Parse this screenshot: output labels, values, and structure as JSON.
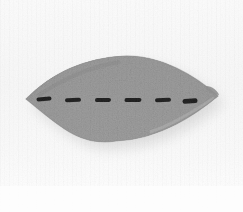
{
  "image": {
    "kind": "photograph",
    "subject": "gray textile leaf-shaped pad with stitched dash marks",
    "background_color": "#fafafa",
    "object": {
      "name": "stitched-fabric-lens-object",
      "fill_color": "#9b9b9b",
      "fill_color_light": "#b4b4b4",
      "fill_color_dark": "#7c7c7c",
      "edge_color": "#8a8a8a",
      "shape": "lens",
      "bounds": {
        "x": 26,
        "y": 56,
        "width": 192,
        "height": 85
      },
      "left_tip": {
        "x": 26,
        "y": 99
      },
      "right_tip": {
        "x": 218,
        "y": 96
      },
      "top_apex": {
        "x": 124,
        "y": 56
      },
      "bottom_apex": {
        "x": 116,
        "y": 141
      }
    },
    "shadow": {
      "name": "cast-shadow",
      "color": "#d8d8d8",
      "offset_x": 6,
      "offset_y": 7,
      "blur": 9
    },
    "marks": {
      "name": "stitch-dashes",
      "count": 6,
      "color": "#1e1e1e",
      "dash_width": 16,
      "dash_height": 4,
      "baseline_y": 99,
      "items": [
        {
          "x": 44,
          "y": 99,
          "width": 15,
          "height": 4,
          "rotation": -4
        },
        {
          "x": 73,
          "y": 100,
          "width": 16,
          "height": 4,
          "rotation": -2
        },
        {
          "x": 103,
          "y": 100,
          "width": 16,
          "height": 4,
          "rotation": -1
        },
        {
          "x": 133,
          "y": 100,
          "width": 17,
          "height": 4,
          "rotation": -1
        },
        {
          "x": 163,
          "y": 100,
          "width": 16,
          "height": 4,
          "rotation": -2
        },
        {
          "x": 190,
          "y": 101,
          "width": 15,
          "height": 5,
          "rotation": -4
        }
      ]
    }
  }
}
